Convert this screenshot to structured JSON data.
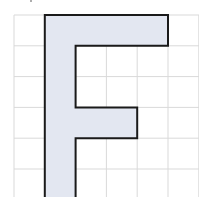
{
  "figure": {
    "letter": "F",
    "grid": {
      "origin_x": 14,
      "origin_y": 15,
      "cell_size": 30.8,
      "columns": 6,
      "rows": 6,
      "line_color": "#d9d9d9"
    },
    "shape": {
      "fill_color": "#e3e7f1",
      "stroke_color": "#1a1a1a",
      "points_grid_units": [
        [
          1,
          0
        ],
        [
          5,
          0
        ],
        [
          5,
          1
        ],
        [
          2,
          1
        ],
        [
          2,
          3
        ],
        [
          4,
          3
        ],
        [
          4,
          4
        ],
        [
          2,
          4
        ],
        [
          2,
          6.2
        ],
        [
          1,
          6.2
        ]
      ]
    }
  }
}
